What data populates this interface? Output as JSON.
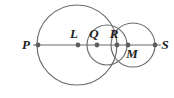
{
  "figure": {
    "canvas": {
      "width": 174,
      "height": 98
    },
    "colors": {
      "stroke": "#6b6b6b",
      "dot": "#5d5d5d",
      "label": "#1d1d1d",
      "background": "#ffffff"
    },
    "line": {
      "name": "PS",
      "x1": 33,
      "y1": 45,
      "x2": 161,
      "y2": 45
    },
    "circles": [
      {
        "id": "big-circle",
        "cx": 77,
        "cy": 45,
        "r": 40
      },
      {
        "id": "middle-circle",
        "cx": 107,
        "cy": 45,
        "r": 20
      },
      {
        "id": "right-circle",
        "cx": 133,
        "cy": 45,
        "r": 22
      }
    ],
    "points": [
      {
        "id": "P",
        "label": "P",
        "cx": 38,
        "cy": 45,
        "r": 2.4,
        "label_x": 26,
        "label_y": 49
      },
      {
        "id": "L",
        "label": "L",
        "cx": 78,
        "cy": 45,
        "r": 2.4,
        "label_x": 74,
        "label_y": 38
      },
      {
        "id": "Q",
        "label": "Q",
        "cx": 97,
        "cy": 45,
        "r": 2.4,
        "label_x": 94,
        "label_y": 38
      },
      {
        "id": "R",
        "label": "R",
        "cx": 117,
        "cy": 45,
        "r": 2.4,
        "label_x": 114,
        "label_y": 38
      },
      {
        "id": "M",
        "label": "M",
        "cx": 128,
        "cy": 45,
        "r": 2.4,
        "label_x": 132,
        "label_y": 58
      },
      {
        "id": "S",
        "label": "S",
        "cx": 155,
        "cy": 45,
        "r": 2.4,
        "label_x": 165,
        "label_y": 49
      }
    ]
  }
}
